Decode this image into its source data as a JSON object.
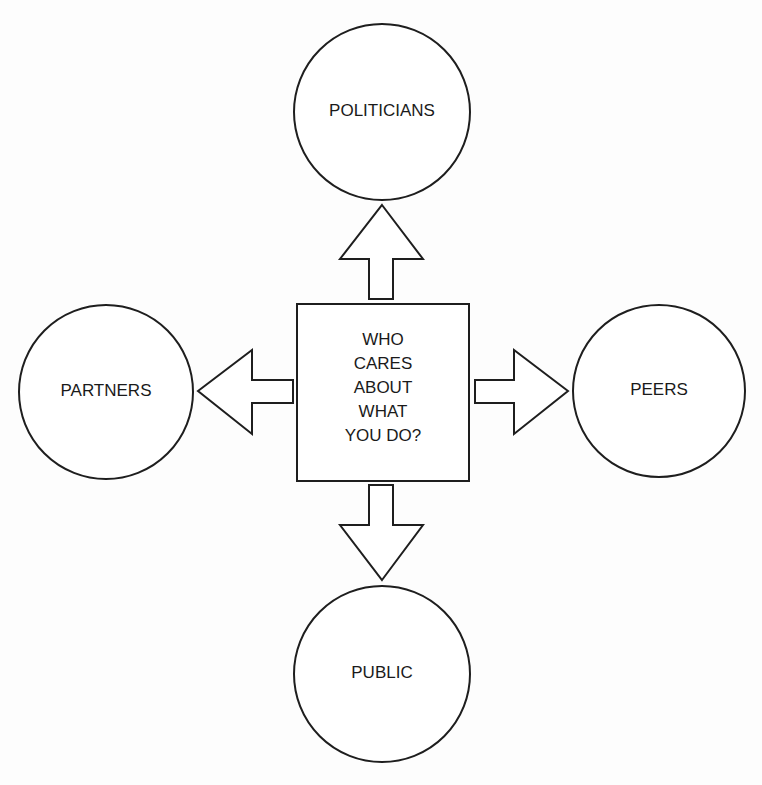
{
  "center": {
    "lines": [
      "WHO",
      "CARES",
      "ABOUT",
      "WHAT",
      "YOU DO?"
    ]
  },
  "nodes": {
    "top": {
      "label": "POLITICIANS"
    },
    "left": {
      "label": "PARTNERS"
    },
    "right": {
      "label": "PEERS"
    },
    "bottom": {
      "label": "PUBLIC"
    }
  },
  "arrows": [
    {
      "from": "center",
      "to": "top",
      "direction": "up"
    },
    {
      "from": "center",
      "to": "left",
      "direction": "left"
    },
    {
      "from": "center",
      "to": "right",
      "direction": "right"
    },
    {
      "from": "center",
      "to": "bottom",
      "direction": "down"
    }
  ],
  "colors": {
    "stroke": "#1e1e1e",
    "fill": "#ffffff",
    "text": "#1a1a1a"
  }
}
